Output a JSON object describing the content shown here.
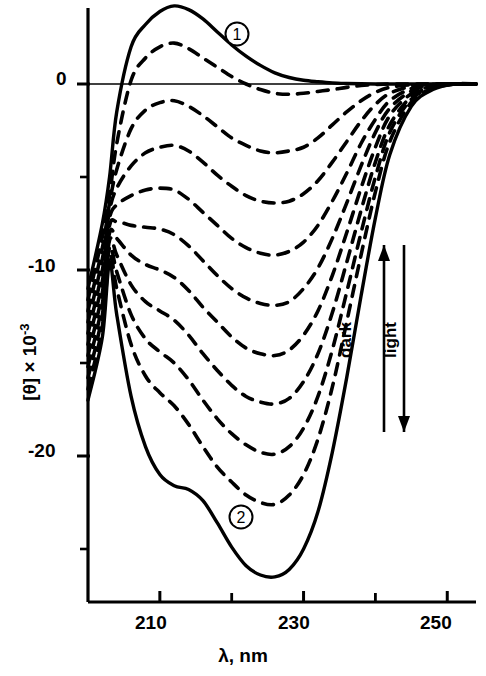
{
  "figure": {
    "title": "",
    "background_color": "#ffffff",
    "ink_color": "#000000",
    "width": 486,
    "height": 676
  },
  "axes": {
    "x": {
      "title_lambda": "λ",
      "title": "λ, nm",
      "unit": "nm",
      "min": 200,
      "max": 254,
      "major_ticks": [
        210,
        230,
        250
      ],
      "minor_ticks": [
        220,
        240
      ],
      "tick_labels": [
        "210",
        "230",
        "250"
      ]
    },
    "y": {
      "title_bracket": "[θ]",
      "title_multiplier": " × 10",
      "title_exponent": "-3",
      "title": "[θ] × 10-3",
      "min": -29,
      "max": 4.5,
      "major_ticks": [
        0,
        -10,
        -20
      ],
      "minor_ticks": [
        -5,
        -15,
        -25
      ],
      "tick_labels": [
        "0",
        "-10",
        "-20"
      ]
    }
  },
  "annotations": {
    "curve_marker_1": "1",
    "curve_marker_2": "2",
    "dark_label": "dark",
    "light_label": "light",
    "dark_arrow_direction": "up",
    "light_arrow_direction": "down"
  },
  "chart_data": {
    "type": "line",
    "title": "",
    "xlabel": "λ, nm",
    "ylabel": "[θ] × 10-3",
    "xlim": [
      200,
      254
    ],
    "ylim": [
      -29,
      4.5
    ],
    "grid": false,
    "legend": "none",
    "zero_line": true,
    "isodichroic_point": {
      "x": 203,
      "y": -6.5
    },
    "x": [
      200,
      202,
      203,
      204,
      206,
      208,
      210,
      212,
      214,
      216,
      218,
      220,
      222,
      224,
      226,
      228,
      230,
      232,
      234,
      236,
      238,
      240,
      242,
      245,
      248,
      251,
      254
    ],
    "series": [
      {
        "name": "1",
        "style": "solid",
        "marker_label": "1",
        "values": [
          -11.0,
          -7.5,
          -5.0,
          -1.5,
          2.0,
          3.2,
          3.9,
          4.2,
          4.0,
          3.5,
          2.8,
          2.1,
          1.5,
          1.0,
          0.6,
          0.35,
          0.2,
          0.12,
          0.06,
          0.03,
          0.01,
          0.0,
          0.0,
          0.0,
          0.0,
          0.0,
          0.0
        ]
      },
      {
        "name": "d1",
        "style": "dashed",
        "values": [
          -11.6,
          -8.2,
          -6.0,
          -3.2,
          0.2,
          1.4,
          2.0,
          2.2,
          1.9,
          1.4,
          0.9,
          0.4,
          0.0,
          -0.3,
          -0.5,
          -0.55,
          -0.5,
          -0.4,
          -0.3,
          -0.18,
          -0.08,
          -0.03,
          0.0,
          0.0,
          0.0,
          0.0,
          0.0
        ]
      },
      {
        "name": "d2",
        "style": "dashed",
        "values": [
          -12.2,
          -8.8,
          -6.4,
          -4.6,
          -2.4,
          -1.4,
          -1.0,
          -0.9,
          -1.2,
          -1.7,
          -2.3,
          -2.9,
          -3.3,
          -3.6,
          -3.7,
          -3.6,
          -3.4,
          -2.9,
          -2.2,
          -1.5,
          -0.9,
          -0.45,
          -0.18,
          -0.04,
          0.0,
          0.0,
          0.0
        ]
      },
      {
        "name": "d3",
        "style": "dashed",
        "values": [
          -12.8,
          -9.4,
          -6.8,
          -5.6,
          -4.4,
          -3.7,
          -3.4,
          -3.3,
          -3.6,
          -4.2,
          -4.9,
          -5.5,
          -6.0,
          -6.3,
          -6.4,
          -6.3,
          -5.9,
          -5.2,
          -4.2,
          -3.1,
          -2.0,
          -1.1,
          -0.5,
          -0.12,
          -0.02,
          0.0,
          0.0
        ]
      },
      {
        "name": "d4",
        "style": "dashed",
        "values": [
          -13.4,
          -10.0,
          -7.2,
          -6.5,
          -6.0,
          -5.7,
          -5.6,
          -5.7,
          -6.2,
          -6.9,
          -7.6,
          -8.3,
          -8.8,
          -9.1,
          -9.2,
          -9.0,
          -8.5,
          -7.6,
          -6.3,
          -4.8,
          -3.2,
          -1.9,
          -0.9,
          -0.25,
          -0.05,
          0.0,
          0.0
        ]
      },
      {
        "name": "d5",
        "style": "dashed",
        "values": [
          -14.0,
          -10.6,
          -7.6,
          -7.4,
          -7.6,
          -7.7,
          -7.8,
          -8.1,
          -8.7,
          -9.5,
          -10.3,
          -11.0,
          -11.5,
          -11.8,
          -11.9,
          -11.7,
          -11.0,
          -9.9,
          -8.3,
          -6.4,
          -4.4,
          -2.6,
          -1.3,
          -0.38,
          -0.08,
          0.0,
          0.0
        ]
      },
      {
        "name": "d6",
        "style": "dashed",
        "values": [
          -14.6,
          -11.2,
          -8.0,
          -8.3,
          -9.2,
          -9.7,
          -10.0,
          -10.4,
          -11.1,
          -12.0,
          -12.8,
          -13.6,
          -14.2,
          -14.5,
          -14.6,
          -14.3,
          -13.5,
          -12.2,
          -10.3,
          -8.0,
          -5.6,
          -3.4,
          -1.7,
          -0.52,
          -0.12,
          0.0,
          0.0
        ]
      },
      {
        "name": "d7",
        "style": "dashed",
        "values": [
          -15.2,
          -11.8,
          -8.4,
          -9.2,
          -10.8,
          -11.7,
          -12.2,
          -12.7,
          -13.5,
          -14.5,
          -15.4,
          -16.2,
          -16.8,
          -17.1,
          -17.2,
          -16.9,
          -16.0,
          -14.5,
          -12.3,
          -9.6,
          -6.8,
          -4.2,
          -2.2,
          -0.68,
          -0.16,
          0.0,
          0.0
        ]
      },
      {
        "name": "d8",
        "style": "dashed",
        "values": [
          -15.8,
          -12.4,
          -8.8,
          -10.1,
          -12.4,
          -13.7,
          -14.4,
          -15.0,
          -15.9,
          -17.0,
          -18.0,
          -18.8,
          -19.4,
          -19.8,
          -19.9,
          -19.5,
          -18.5,
          -16.8,
          -14.3,
          -11.2,
          -8.0,
          -5.0,
          -2.6,
          -0.82,
          -0.2,
          0.0,
          0.0
        ]
      },
      {
        "name": "d9",
        "style": "dashed",
        "values": [
          -16.4,
          -13.0,
          -9.2,
          -11.0,
          -14.0,
          -15.7,
          -16.6,
          -17.3,
          -18.3,
          -19.5,
          -20.6,
          -21.4,
          -22.1,
          -22.5,
          -22.6,
          -22.1,
          -21.0,
          -19.1,
          -16.3,
          -12.8,
          -9.2,
          -5.8,
          -3.1,
          -0.98,
          -0.24,
          0.0,
          0.0
        ]
      },
      {
        "name": "2",
        "style": "solid",
        "marker_label": "2",
        "values": [
          -17.0,
          -13.6,
          -9.6,
          -12.4,
          -16.8,
          -19.5,
          -21.0,
          -21.6,
          -21.8,
          -22.4,
          -23.6,
          -24.9,
          -25.9,
          -26.4,
          -26.5,
          -26.1,
          -25.0,
          -23.0,
          -19.8,
          -15.8,
          -11.4,
          -7.2,
          -3.8,
          -1.2,
          -0.3,
          0.0,
          0.0
        ]
      }
    ]
  }
}
